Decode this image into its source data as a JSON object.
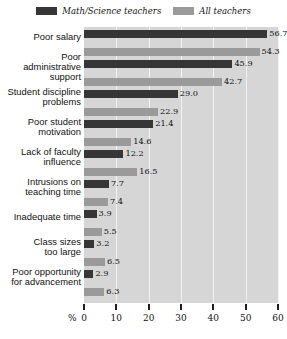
{
  "legend": {
    "position": "top-center",
    "entries": [
      {
        "label": "Math/Science teachers",
        "color": "#363636",
        "swatch_name": "legend-swatch-math-science"
      },
      {
        "label": "All teachers",
        "color": "#9a9a9a",
        "swatch_name": "legend-swatch-all-teachers"
      }
    ]
  },
  "axis": {
    "unit_label": "%",
    "ticks": [
      "0",
      "10",
      "20",
      "30",
      "40",
      "50",
      "60"
    ]
  },
  "chart_data": {
    "type": "bar",
    "orientation": "horizontal",
    "title": "",
    "xlabel": "%",
    "ylabel": "",
    "xlim": [
      0,
      60
    ],
    "grid": true,
    "legend_position": "top-center",
    "categories": [
      "Poor salary",
      "Poor administrative support",
      "Student discipline problems",
      "Poor student motivation",
      "Lack of faculty influence",
      "Intrusions on teaching time",
      "Inadequate time",
      "Class sizes too large",
      "Poor opportunity for advancement"
    ],
    "category_lines": [
      [
        "Poor salary"
      ],
      [
        "Poor",
        "administrative",
        "support"
      ],
      [
        "Student discipline",
        "problems"
      ],
      [
        "Poor student",
        "motivation"
      ],
      [
        "Lack of faculty",
        "influence"
      ],
      [
        "Intrusions on",
        "teaching time"
      ],
      [
        "Inadequate time"
      ],
      [
        "Class sizes",
        "too large"
      ],
      [
        "Poor opportunity",
        "for advancement"
      ]
    ],
    "series": [
      {
        "name": "Math/Science teachers",
        "color": "#363636",
        "values": [
          56.7,
          45.9,
          29.0,
          21.4,
          12.2,
          7.7,
          3.9,
          3.2,
          2.9
        ],
        "value_labels": [
          "56.7",
          "45.9",
          "29.0",
          "21.4",
          "12.2",
          "7.7",
          "3.9",
          "3.2",
          "2.9"
        ]
      },
      {
        "name": "All teachers",
        "color": "#9a9a9a",
        "values": [
          54.3,
          42.7,
          22.9,
          14.6,
          16.5,
          7.4,
          5.5,
          6.5,
          6.3
        ],
        "value_labels": [
          "54.3",
          "42.7",
          "22.9",
          "14.6",
          "16.5",
          "7.4",
          "5.5",
          "6.5",
          "6.3"
        ]
      }
    ]
  },
  "colors": {
    "plot_background": "#d6d6d6",
    "gridline": "#f2f2f2",
    "page_background": "#ffffff"
  }
}
